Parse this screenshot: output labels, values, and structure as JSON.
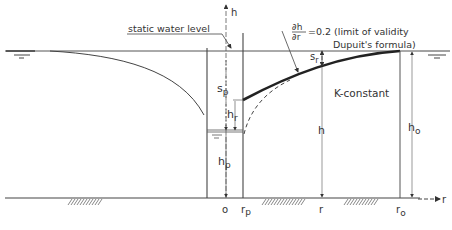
{
  "figure": {
    "labels": {
      "static_water_level": "static water level",
      "h_axis": "h",
      "r_axis": "r",
      "derivative_num": "∂h",
      "derivative_den": "∂r",
      "derivative_value": "=0.2 (limit of validity",
      "dupuit_formula": "Dupuit's formula)",
      "k_constant": "K-constant",
      "sp": "s",
      "sp_sub": "p",
      "sr": "s",
      "sr_sub": "r",
      "hr": "h",
      "hr_sub": "r",
      "hp": "h",
      "hp_sub": "p",
      "h": "h",
      "h0": "h",
      "h0_sub": "o",
      "origin": "o",
      "rp": "r",
      "rp_sub": "p",
      "r": "r",
      "r0": "r",
      "r0_sub": "o"
    },
    "colors": {
      "ink": "#333333",
      "background": "#ffffff"
    }
  }
}
